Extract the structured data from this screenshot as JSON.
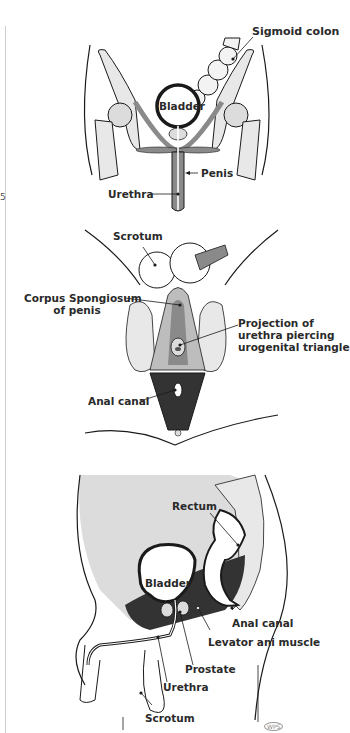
{
  "page": {
    "margin_number": "5",
    "colors": {
      "line": "#1a1a1a",
      "bone": "#e8e8e8",
      "muscle_mid": "#8a8a8a",
      "muscle_dark": "#333333",
      "tissue_light": "#dcdcdc",
      "background": "#ffffff"
    }
  },
  "figures": [
    {
      "id": "anterior-view",
      "labels": {
        "sigmoid_colon": "Sigmoid colon",
        "bladder": "Bladder",
        "penis": "Penis",
        "urethra": "Urethra"
      }
    },
    {
      "id": "inferior-perineal-view",
      "labels": {
        "scrotum": "Scrotum",
        "corpus_spongiosum": "Corpus Spongiosum\n        of penis",
        "projection": "Projection of\nurethra piercing\nurogenital triangle",
        "anal_canal": "Anal canal"
      }
    },
    {
      "id": "sagittal-view",
      "labels": {
        "rectum": "Rectum",
        "bladder": "Bladder",
        "anal_canal": "Anal canal",
        "levator_ani": "Levator ani muscle",
        "prostate": "Prostate",
        "urethra": "Urethra",
        "scrotum": "Scrotum"
      },
      "signature": "WPS"
    }
  ]
}
